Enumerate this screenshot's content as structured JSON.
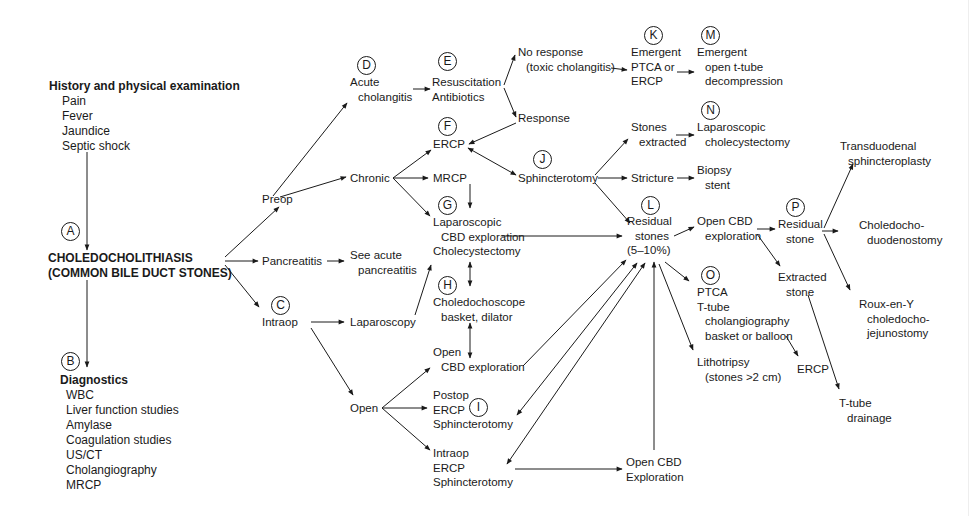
{
  "colors": {
    "ink": "#1a1a1a",
    "background": "#ffffff"
  },
  "badges": {
    "A": "A",
    "B": "B",
    "C": "C",
    "D": "D",
    "E": "E",
    "F": "F",
    "G": "G",
    "H": "H",
    "I": "I",
    "J": "J",
    "K": "K",
    "L": "L",
    "M": "M",
    "N": "N",
    "O": "O",
    "P": "P"
  },
  "history": {
    "heading": "History and physical examination",
    "items": [
      "Pain",
      "Fever",
      "Jaundice",
      "Septic shock"
    ]
  },
  "main": {
    "line1": "CHOLEDOCHOLITHIASIS",
    "line2": "(COMMON BILE DUCT STONES)"
  },
  "diagnostics": {
    "heading": "Diagnostics",
    "items": [
      "WBC",
      "Liver function studies",
      "Amylase",
      "Coagulation studies",
      "US/CT",
      "Cholangiography",
      "MRCP"
    ]
  },
  "nodes": {
    "preop": "Preop",
    "pancreatitis": "Pancreatitis",
    "intraop": "Intraop",
    "see_acute": [
      "See acute",
      "pancreatitis"
    ],
    "acute_cholangitis": [
      "Acute",
      "cholangitis"
    ],
    "chronic": "Chronic",
    "laparoscopy": "Laparoscopy",
    "open": "Open",
    "resuscitation": [
      "Resuscitation",
      "Antibiotics"
    ],
    "no_response": [
      "No response",
      "(toxic cholangitis)"
    ],
    "response": "Response",
    "ercp_f": "ERCP",
    "mrcp": "MRCP",
    "lap_cbd": [
      "Laparoscopic",
      "CBD exploration",
      "Cholecystectomy"
    ],
    "choledochoscope": [
      "Choledochoscope",
      "basket, dilator"
    ],
    "open_cbd": [
      "Open",
      "CBD exploration"
    ],
    "postop_ercp": [
      "Postop",
      "ERCP",
      "Sphincterotomy"
    ],
    "intraop_ercp": [
      "Intraop",
      "ERCP",
      "Sphincterotomy"
    ],
    "sphincterotomy": "Sphincterotomy",
    "emergent_ptca": [
      "Emergent",
      "PTCA or",
      "ERCP"
    ],
    "emergent_open": [
      "Emergent",
      "open t-tube",
      "decompression"
    ],
    "stones_extracted": [
      "Stones",
      "extracted"
    ],
    "lap_chole": [
      "Laparoscopic",
      "cholecystectomy"
    ],
    "stricture": "Stricture",
    "biopsy": [
      "Biopsy",
      "stent"
    ],
    "residual_stones": [
      "Residual",
      "stones",
      "(5–10%)"
    ],
    "open_cbd_exploration_l": [
      "Open CBD",
      "exploration"
    ],
    "ptca_ttube": [
      "PTCA",
      "T-tube",
      "cholangiography",
      "basket or balloon"
    ],
    "lithotripsy": [
      "Lithotripsy",
      "(stones >2 cm)"
    ],
    "open_cbd_exploration_bottom": [
      "Open CBD",
      "Exploration"
    ],
    "residual_stone_p": [
      "Residual",
      "stone"
    ],
    "extracted_stone": [
      "Extracted",
      "stone"
    ],
    "ercp_bottom": "ERCP",
    "ttube_drainage": [
      "T-tube",
      "drainage"
    ],
    "transduodenal": [
      "Transduodenal",
      "sphincteroplasty"
    ],
    "choledochoduodenostomy": [
      "Choledocho-",
      "duodenostomy"
    ],
    "roux": [
      "Roux-en-Y",
      "choledocho-",
      "jejunostomy"
    ]
  }
}
